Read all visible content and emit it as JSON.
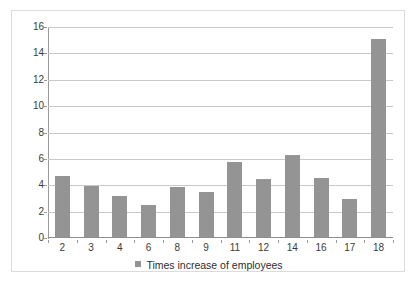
{
  "chart_data": {
    "type": "bar",
    "title": "",
    "xlabel": "",
    "ylabel": "",
    "categories": [
      "2",
      "3",
      "4",
      "6",
      "8",
      "9",
      "11",
      "12",
      "14",
      "16",
      "17",
      "18"
    ],
    "values": [
      4.65,
      3.85,
      3.1,
      2.4,
      3.8,
      3.4,
      5.7,
      4.4,
      6.2,
      4.5,
      2.9,
      15.0
    ],
    "series": [
      {
        "name": "Times increase of employees",
        "values": [
          4.65,
          3.85,
          3.1,
          2.4,
          3.8,
          3.4,
          5.7,
          4.4,
          6.2,
          4.5,
          2.9,
          15.0
        ],
        "color": "#949494"
      }
    ],
    "ylim": [
      0,
      16
    ],
    "yticks": [
      0,
      2,
      4,
      6,
      8,
      10,
      12,
      14,
      16
    ],
    "ytick_labels": [
      "0",
      "2",
      "4",
      "6",
      "8",
      "10",
      "12",
      "14",
      "16"
    ],
    "xtick_labels": [
      "2",
      "3",
      "4",
      "6",
      "8",
      "9",
      "11",
      "12",
      "14",
      "16",
      "17",
      "18"
    ],
    "grid": true,
    "grid_color": "#c8c8c8",
    "legend": {
      "position": "bottom",
      "entries": [
        {
          "label": "Times increase of employees",
          "color": "#949494",
          "marker": "square"
        }
      ]
    },
    "border_color": "#dcdcdc",
    "background": "#ffffff"
  }
}
